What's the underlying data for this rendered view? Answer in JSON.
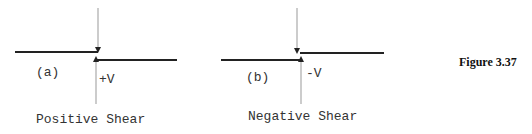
{
  "diagrams": [
    {
      "label": "(a)",
      "force": "+V",
      "caption": "Positive Shear"
    },
    {
      "label": "(b)",
      "force": "-V",
      "caption": "Negative Shear"
    }
  ],
  "figure_label": "Figure 3.37"
}
